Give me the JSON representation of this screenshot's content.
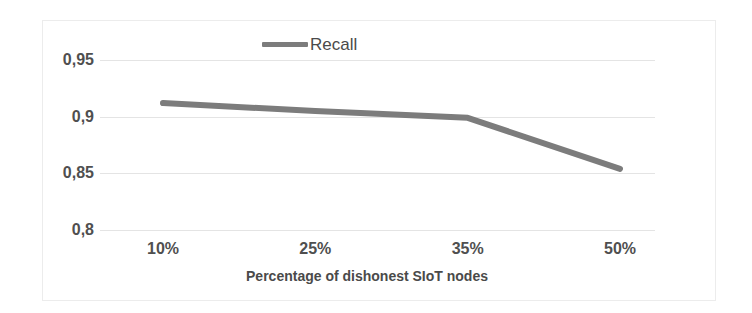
{
  "chart_data": {
    "type": "line",
    "title": "",
    "xlabel": "Percentage of dishonest SIoT nodes",
    "ylabel": "",
    "categories": [
      "10%",
      "25%",
      "35%",
      "50%"
    ],
    "series": [
      {
        "name": "Recall",
        "values": [
          0.912,
          0.905,
          0.899,
          0.854
        ],
        "color": "#7c7c7c"
      }
    ],
    "ylim": [
      0.8,
      0.95
    ],
    "y_ticks": [
      "0,8",
      "0,85",
      "0,9",
      "0,95"
    ],
    "y_tick_values": [
      0.8,
      0.85,
      0.9,
      0.95
    ],
    "grid": true,
    "legend_position": "top-center",
    "legend_entries": [
      "Recall"
    ]
  },
  "legend": {
    "recall_label": "Recall",
    "swatch_name": "line-swatch"
  },
  "axis": {
    "x_title": "Percentage of dishonest SIoT nodes",
    "x_ticks": [
      "10%",
      "25%",
      "35%",
      "50%"
    ],
    "y_ticks": [
      "0,95",
      "0,9",
      "0,85",
      "0,8"
    ]
  },
  "colors": {
    "series": "#7c7c7c",
    "grid": "#e4e4e4",
    "text": "#4f4f4f",
    "frame": "#ececec",
    "background": "#ffffff"
  }
}
